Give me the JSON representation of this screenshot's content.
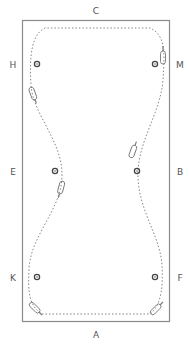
{
  "diagram": {
    "type": "dressage-arena-pattern",
    "colors": {
      "border": "#8a8a8a",
      "path": "#777777",
      "marker": "#444444",
      "text": "#555555",
      "horse": "#777777"
    },
    "letters": {
      "top": "C",
      "bottom": "A",
      "left": [
        "H",
        "E",
        "K"
      ],
      "right": [
        "M",
        "B",
        "F"
      ]
    },
    "markers": [
      "H-dot",
      "M-dot",
      "E-dot",
      "B-dot",
      "K-dot",
      "F-dot"
    ],
    "horses": [
      "near-M",
      "near-H",
      "near-B",
      "near-E",
      "near-K-corner",
      "near-F-corner"
    ]
  }
}
